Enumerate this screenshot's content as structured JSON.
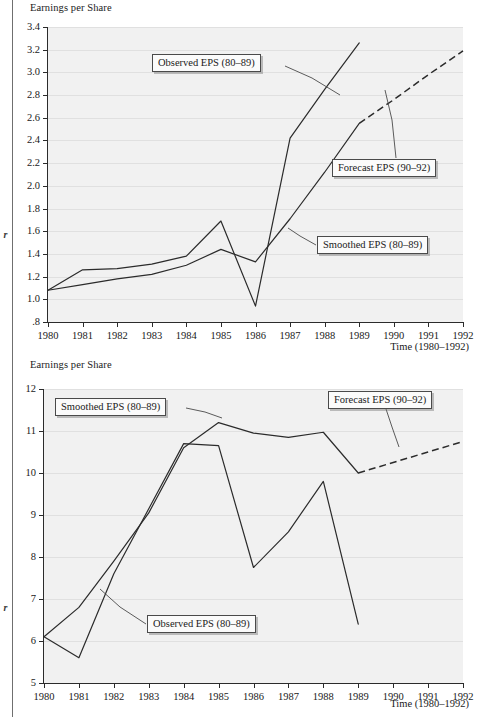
{
  "page": {
    "margin_glyph_top": "r",
    "margin_glyph_bottom": "r"
  },
  "figures": [
    {
      "id": "top",
      "y_axis_title": "Earnings per Share",
      "x_axis_title": "Time (1980–1992)",
      "callouts": [
        {
          "id": "observed",
          "label": "Observed EPS (80–89)"
        },
        {
          "id": "forecast",
          "label": "Forecast EPS (90–92)"
        },
        {
          "id": "smoothed",
          "label": "Smoothed EPS (80–89)"
        }
      ]
    },
    {
      "id": "bottom",
      "y_axis_title": "Earnings per Share",
      "x_axis_title": "Time (1980–1992)",
      "callouts": [
        {
          "id": "smoothed",
          "label": "Smoothed EPS (80–89)"
        },
        {
          "id": "forecast",
          "label": "Forecast EPS (90–92)"
        },
        {
          "id": "observed",
          "label": "Observed EPS (80–89)"
        }
      ]
    }
  ],
  "chart_data": [
    {
      "type": "line",
      "id": "top",
      "title": "",
      "ylabel": "Earnings per Share",
      "xlabel": "Time (1980–1992)",
      "grid": true,
      "legend": "callout-boxes",
      "x": [
        1980,
        1981,
        1982,
        1983,
        1984,
        1985,
        1986,
        1987,
        1988,
        1989,
        1990,
        1991,
        1992
      ],
      "xticklabels": [
        "1980",
        "1981",
        "1982",
        "1983",
        "1984",
        "1985",
        "1986",
        "1987",
        "1988",
        "1989",
        "1990",
        "1991",
        "1992"
      ],
      "xlim": [
        1980,
        1992
      ],
      "ylim": [
        0.8,
        3.4
      ],
      "yticks": [
        0.8,
        1.0,
        1.2,
        1.4,
        1.6,
        1.8,
        2.0,
        2.2,
        2.4,
        2.6,
        2.8,
        3.0,
        3.2,
        3.4
      ],
      "yticklabels": [
        ".8",
        "1.0",
        "1.2",
        "1.4",
        "1.6",
        "1.8",
        "2.0",
        "2.2",
        "2.4",
        "2.6",
        "2.8",
        "3.0",
        "3.2",
        "3.4"
      ],
      "series": [
        {
          "name": "Observed EPS (80–89)",
          "style": "solid",
          "x": [
            1980,
            1981,
            1982,
            1983,
            1984,
            1985,
            1986,
            1987,
            1988,
            1989
          ],
          "values": [
            1.08,
            1.26,
            1.27,
            1.31,
            1.38,
            1.69,
            0.94,
            2.42,
            2.85,
            3.26
          ]
        },
        {
          "name": "Smoothed EPS (80–89)",
          "style": "solid",
          "x": [
            1980,
            1981,
            1982,
            1983,
            1984,
            1985,
            1986,
            1987,
            1988,
            1989
          ],
          "values": [
            1.08,
            1.13,
            1.18,
            1.22,
            1.3,
            1.44,
            1.33,
            1.71,
            2.12,
            2.55
          ]
        },
        {
          "name": "Forecast EPS (90–92)",
          "style": "dashed",
          "x": [
            1989,
            1990,
            1991,
            1992
          ],
          "values": [
            2.55,
            2.76,
            2.98,
            3.19
          ]
        }
      ]
    },
    {
      "type": "line",
      "id": "bottom",
      "title": "",
      "ylabel": "Earnings per Share",
      "xlabel": "Time (1980–1992)",
      "grid": true,
      "legend": "callout-boxes",
      "x": [
        1980,
        1981,
        1982,
        1983,
        1984,
        1985,
        1986,
        1987,
        1988,
        1989,
        1990,
        1991,
        1992
      ],
      "xticklabels": [
        "1980",
        "1981",
        "1982",
        "1983",
        "1984",
        "1985",
        "1986",
        "1987",
        "1988",
        "1989",
        "1990",
        "1991",
        "1992"
      ],
      "xlim": [
        1980,
        1992
      ],
      "ylim": [
        5,
        12
      ],
      "yticks": [
        5,
        6,
        7,
        8,
        9,
        10,
        11,
        12
      ],
      "yticklabels": [
        "5",
        "6",
        "7",
        "8",
        "9",
        "10",
        "11",
        "12"
      ],
      "series": [
        {
          "name": "Observed EPS (80–89)",
          "style": "solid",
          "x": [
            1980,
            1981,
            1982,
            1983,
            1984,
            1985,
            1986,
            1987,
            1988,
            1989
          ],
          "values": [
            6.1,
            5.6,
            7.6,
            9.15,
            10.7,
            10.65,
            7.75,
            8.6,
            9.8,
            6.4
          ]
        },
        {
          "name": "Smoothed EPS (80–89)",
          "style": "solid",
          "x": [
            1980,
            1981,
            1982,
            1983,
            1984,
            1985,
            1986,
            1987,
            1988,
            1989
          ],
          "values": [
            6.1,
            6.8,
            7.9,
            9.05,
            10.6,
            11.2,
            10.95,
            10.85,
            10.97,
            10.0
          ]
        },
        {
          "name": "Forecast EPS (90–92)",
          "style": "dashed",
          "x": [
            1989,
            1990,
            1991,
            1992
          ],
          "values": [
            10.0,
            10.25,
            10.5,
            10.75
          ]
        }
      ]
    }
  ]
}
